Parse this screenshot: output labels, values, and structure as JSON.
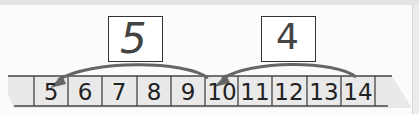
{
  "number_line": {
    "cells": [
      "5",
      "6",
      "7",
      "8",
      "9",
      "10",
      "11",
      "12",
      "13",
      "14"
    ],
    "cell_left_edges": [
      34,
      68,
      102,
      137,
      171,
      205,
      238,
      272,
      307,
      341
    ],
    "cell_width": 34
  },
  "jumps": [
    {
      "from": "10",
      "to": "5",
      "answer": "5"
    },
    {
      "from": "14",
      "to": "10",
      "answer": "4"
    }
  ],
  "colors": {
    "strip_fill": "#e9e9e9",
    "line": "#333333",
    "arrow": "#666666",
    "handwriting": "#444444"
  }
}
